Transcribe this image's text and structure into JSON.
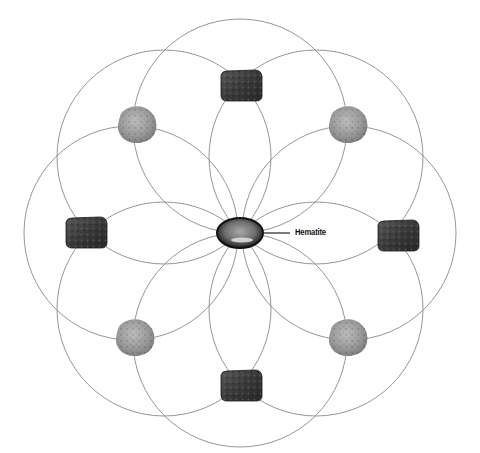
{
  "diagram": {
    "type": "crystal-grid",
    "layout": "seed-of-life / flower pattern of 8 overlapping circles",
    "center": {
      "x": 240,
      "y": 233
    },
    "circle_radius": 107,
    "circle_stroke": "#8a8a8a",
    "circles": [
      {
        "cx": 240,
        "cy": 126
      },
      {
        "cx": 316,
        "cy": 157
      },
      {
        "cx": 349,
        "cy": 233
      },
      {
        "cx": 316,
        "cy": 309
      },
      {
        "cx": 240,
        "cy": 340
      },
      {
        "cx": 164,
        "cy": 309
      },
      {
        "cx": 131,
        "cy": 233
      },
      {
        "cx": 164,
        "cy": 157
      }
    ],
    "center_stone": {
      "name": "Hematite",
      "label": "Hematite",
      "shape": "polished-oval",
      "x": 240,
      "y": 233,
      "w": 46,
      "h": 30,
      "color": "#4a4a4a"
    },
    "stones": [
      {
        "position": "top",
        "shape": "dark-rough-slab",
        "x": 241,
        "y": 86,
        "color": "#3c3c3c"
      },
      {
        "position": "top-right",
        "shape": "light-rough-nugget",
        "x": 348,
        "y": 124,
        "color": "#9a9a9a"
      },
      {
        "position": "right",
        "shape": "dark-rough-slab",
        "x": 398,
        "y": 236,
        "color": "#3c3c3c"
      },
      {
        "position": "bottom-right",
        "shape": "light-rough-nugget",
        "x": 348,
        "y": 337,
        "color": "#9a9a9a"
      },
      {
        "position": "bottom",
        "shape": "dark-rough-slab",
        "x": 241,
        "y": 386,
        "color": "#3c3c3c"
      },
      {
        "position": "bottom-left",
        "shape": "light-rough-nugget",
        "x": 135,
        "y": 337,
        "color": "#9a9a9a"
      },
      {
        "position": "left",
        "shape": "dark-rough-slab",
        "x": 86,
        "y": 233,
        "color": "#3c3c3c"
      },
      {
        "position": "top-left",
        "shape": "light-rough-nugget",
        "x": 137,
        "y": 124,
        "color": "#9a9a9a"
      }
    ],
    "leader_line": {
      "x1": 263,
      "y1": 233,
      "x2": 290,
      "y2": 233
    }
  }
}
